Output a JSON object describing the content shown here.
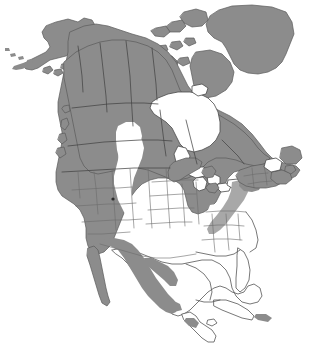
{
  "figure": {
    "type": "range-map",
    "width": 332,
    "height": 356,
    "background_color": "#ffffff",
    "range_fill_color": "#8c8c8c",
    "range_fill_color_light": "#a8a8a8",
    "outline_color": "#555555",
    "border_color": "#444444",
    "water_color": "#ffffff",
    "has_frame": false,
    "has_labels": false,
    "has_legend": false,
    "has_scale_bar": false,
    "has_graticule": false
  },
  "map": {
    "projection_hint": "conic",
    "extent": "North America including Alaska, Canada, Greenland, continental United States, Mexico, Central America and Cuba",
    "legend_meaning": "Shaded gray areas indicate species distribution; white areas indicate absence or water"
  },
  "regions": [
    {
      "name": "alaska",
      "label": "Alaska",
      "shaded": true,
      "note": "Mainland Alaska and Aleutian island chain shaded"
    },
    {
      "name": "aleutian-islands",
      "label": "Aleutian Islands",
      "shaded": true,
      "note": "Small chain of shaded islands extending southwest"
    },
    {
      "name": "yukon-territory",
      "label": "Yukon",
      "shaded": true
    },
    {
      "name": "northwest-territories",
      "label": "Northwest Territories",
      "shaded": true
    },
    {
      "name": "nunavut",
      "label": "Nunavut",
      "shaded": true
    },
    {
      "name": "arctic-archipelago",
      "label": "Canadian Arctic Archipelago",
      "shaded": true,
      "note": "Banks, Victoria, Baffin and Ellesmere islands shaded"
    },
    {
      "name": "greenland",
      "label": "Greenland",
      "shaded": true
    },
    {
      "name": "british-columbia",
      "label": "British Columbia",
      "shaded": true
    },
    {
      "name": "alberta",
      "label": "Alberta",
      "shaded": true,
      "note": "White unshaded gap in southern prairie"
    },
    {
      "name": "saskatchewan",
      "label": "Saskatchewan",
      "shaded": true,
      "note": "Partial white gap in south"
    },
    {
      "name": "manitoba",
      "label": "Manitoba",
      "shaded": true
    },
    {
      "name": "ontario",
      "label": "Ontario",
      "shaded": true
    },
    {
      "name": "quebec",
      "label": "Quebec",
      "shaded": true
    },
    {
      "name": "labrador-newfoundland",
      "label": "Newfoundland and Labrador",
      "shaded": true
    },
    {
      "name": "maritime-provinces",
      "label": "Maritime Provinces",
      "shaded": true
    },
    {
      "name": "hudson-bay",
      "label": "Hudson Bay",
      "shaded": false,
      "note": "Water body rendered white"
    },
    {
      "name": "great-lakes",
      "label": "Great Lakes",
      "shaded": false,
      "note": "Water bodies rendered white"
    },
    {
      "name": "western-united-states",
      "label": "Western United States",
      "shaded": true,
      "note": "Washington, Oregon, California, Idaho, Nevada, Utah, Arizona, Montana, Wyoming, Colorado, New Mexico shaded"
    },
    {
      "name": "great-plains",
      "label": "Great Plains",
      "shaded": false,
      "note": "Dakotas, Nebraska, Kansas, Oklahoma, Texas unshaded white"
    },
    {
      "name": "upper-midwest",
      "label": "Upper Midwest",
      "shaded": true,
      "note": "Minnesota, Wisconsin, Michigan shaded around Great Lakes"
    },
    {
      "name": "northeast-united-states",
      "label": "Northeastern United States",
      "shaded": true,
      "note": "New England, New York, Pennsylvania shaded"
    },
    {
      "name": "appalachian-corridor",
      "label": "Appalachian Mountains",
      "shaded": true,
      "note": "Narrow shaded band extending south along the range"
    },
    {
      "name": "southeastern-united-states",
      "label": "Southeastern United States",
      "shaded": false,
      "note": "Florida and Gulf states unshaded"
    },
    {
      "name": "baja-california",
      "label": "Baja California",
      "shaded": true
    },
    {
      "name": "sierra-madre-occidental",
      "label": "Sierra Madre Occidental",
      "shaded": true
    },
    {
      "name": "sierra-madre-oriental",
      "label": "Sierra Madre Oriental",
      "shaded": true,
      "note": "Narrow shaded band along eastern Mexico"
    },
    {
      "name": "trans-mexican-volcanic-belt",
      "label": "Trans-Mexican Volcanic Belt",
      "shaded": true
    },
    {
      "name": "yucatan-peninsula",
      "label": "Yucatan Peninsula",
      "shaded": false
    },
    {
      "name": "cuba",
      "label": "Cuba",
      "shaded": false
    },
    {
      "name": "hispaniola",
      "label": "Hispaniola",
      "shaded": true,
      "note": "Small shaded patch"
    }
  ]
}
